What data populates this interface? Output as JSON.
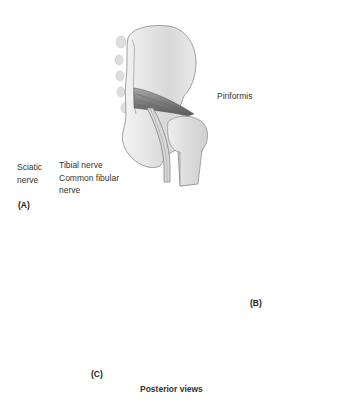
{
  "figure": {
    "title": "Posterior views",
    "panels": [
      {
        "id": "A",
        "label": "(A)",
        "variant": "nerve passes below piriformis"
      },
      {
        "id": "B",
        "label": "(B)",
        "variant": "common fibular division pierces piriformis"
      },
      {
        "id": "C",
        "label": "(C)",
        "variant": "common fibular division passes above piriformis"
      }
    ],
    "annotations": {
      "piriformis": "Piriformis",
      "sciatic_line1": "Sciatic",
      "sciatic_line2": "nerve",
      "tibial": "Tibial nerve",
      "common_fibular_line1": "Common fibular",
      "common_fibular_line2": "nerve"
    },
    "colors": {
      "bone_fill": "#ececec",
      "bone_shade": "#c9c9c9",
      "bone_outline": "#8a8a8a",
      "muscle": "#8c8c8c",
      "muscle_dark": "#5e5e5e",
      "nerve": "#d4d4d4",
      "nerve_outline": "#7a7a7a"
    }
  }
}
